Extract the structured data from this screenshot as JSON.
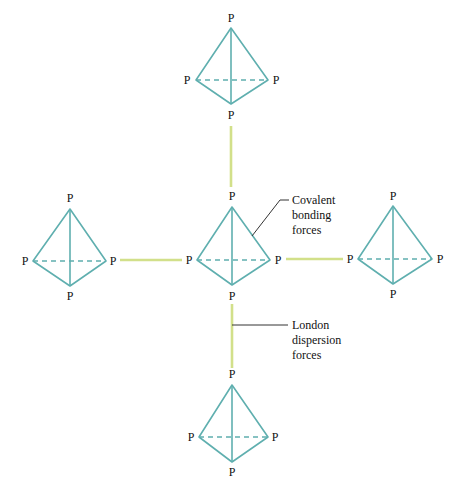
{
  "diagram": {
    "atom_label": "P",
    "colors": {
      "tetrahedron_edge": "#5fafaf",
      "intermolecular_force": "#d2e08a",
      "leader_line": "#333333",
      "text": "#111111"
    },
    "molecules": [
      {
        "id": "top",
        "labels": [
          "P",
          "P",
          "P",
          "P"
        ]
      },
      {
        "id": "left",
        "labels": [
          "P",
          "P",
          "P",
          "P"
        ]
      },
      {
        "id": "center",
        "labels": [
          "P",
          "P",
          "P",
          "P"
        ]
      },
      {
        "id": "right",
        "labels": [
          "P",
          "P",
          "P",
          "P"
        ]
      },
      {
        "id": "bottom",
        "labels": [
          "P",
          "P",
          "P",
          "P"
        ]
      }
    ],
    "annotations": {
      "covalent": {
        "lines": [
          "Covalent",
          "bonding",
          "forces"
        ]
      },
      "london": {
        "lines": [
          "London",
          "dispersion",
          "forces"
        ]
      }
    }
  }
}
